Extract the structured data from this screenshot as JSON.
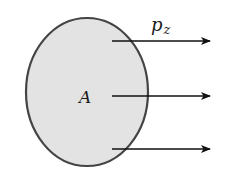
{
  "diagram": {
    "area_label": "A",
    "momentum_label": "p",
    "momentum_subscript": "z",
    "colors": {
      "fill": "#e3e3e3",
      "stroke": "#444444",
      "arrow": "#111111"
    },
    "arrows": [
      {
        "id": "top",
        "y": 41
      },
      {
        "id": "middle",
        "y": 96
      },
      {
        "id": "bottom",
        "y": 149
      }
    ]
  }
}
